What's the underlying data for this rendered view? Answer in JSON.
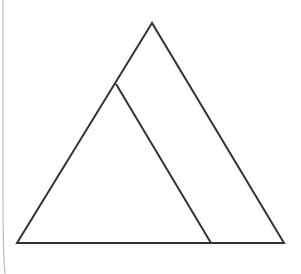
{
  "diagram": {
    "type": "geometry",
    "stroke_color": "#333333",
    "page_edge_color": "#bbbbbb",
    "outer_triangle": {
      "apex": [
        152,
        23
      ],
      "base_left": [
        17,
        243
      ],
      "base_right": [
        284,
        243
      ]
    },
    "inner_segment": {
      "top": [
        116,
        84
      ],
      "bottom": [
        211,
        243
      ]
    }
  }
}
